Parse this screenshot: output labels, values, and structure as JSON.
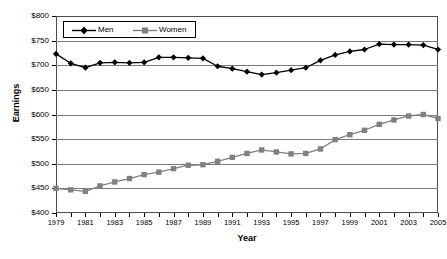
{
  "chart_data": {
    "type": "line",
    "title": "",
    "xlabel": "Year",
    "ylabel": "Earnings",
    "x": [
      1979,
      1980,
      1981,
      1982,
      1983,
      1984,
      1985,
      1986,
      1987,
      1988,
      1989,
      1990,
      1991,
      1992,
      1993,
      1994,
      1995,
      1996,
      1997,
      1998,
      1999,
      2000,
      2001,
      2002,
      2003,
      2004,
      2005
    ],
    "xtick_labels": [
      "1979",
      "1981",
      "1983",
      "1985",
      "1987",
      "1989",
      "1991",
      "1993",
      "1995",
      "1997",
      "1999",
      "2001",
      "2003",
      "2005"
    ],
    "ytick_labels": [
      "$400",
      "$450",
      "$500",
      "$550",
      "$600",
      "$650",
      "$700",
      "$750",
      "$800"
    ],
    "ylim": [
      400,
      800
    ],
    "xlim": [
      1979,
      2005
    ],
    "ytick_values": [
      400,
      450,
      500,
      550,
      600,
      650,
      700,
      750,
      800
    ],
    "grid": "horizontal",
    "legend_position": "top-left-inside",
    "series": [
      {
        "name": "Men",
        "marker": "diamond",
        "color": "#000000",
        "values": [
          723,
          704,
          695,
          705,
          706,
          705,
          706,
          716,
          716,
          715,
          714,
          698,
          693,
          687,
          681,
          685,
          690,
          695,
          710,
          721,
          728,
          732,
          743,
          742,
          742,
          741,
          732
        ]
      },
      {
        "name": "Women",
        "marker": "square",
        "color": "#808080",
        "values": [
          450,
          447,
          444,
          455,
          463,
          470,
          478,
          483,
          490,
          497,
          498,
          505,
          513,
          521,
          528,
          524,
          520,
          521,
          530,
          549,
          559,
          568,
          580,
          589,
          597,
          600,
          592
        ]
      }
    ]
  },
  "legend": {
    "entries": [
      {
        "label": "Men"
      },
      {
        "label": "Women"
      }
    ]
  },
  "axes": {
    "y_title": "Earnings",
    "x_title": "Year"
  }
}
